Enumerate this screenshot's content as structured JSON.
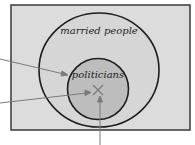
{
  "diagram": {
    "type": "euler",
    "sets": [
      {
        "name": "outer",
        "label": "married people"
      },
      {
        "name": "inner",
        "label": "politicians"
      }
    ],
    "marker": "X",
    "colors": {
      "background": "#dcdcdc",
      "inner_fill": "#bdbdbd",
      "border": "#222222",
      "arrow": "#7a7a7a"
    }
  }
}
